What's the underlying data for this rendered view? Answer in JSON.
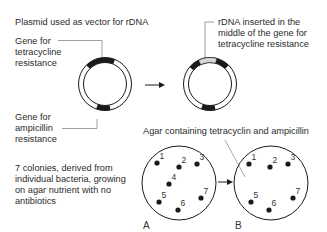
{
  "title": "Plasmid used as vector for rDNA",
  "labels": {
    "tet_gene": [
      "Gene for",
      "tetracycline",
      "resistance"
    ],
    "amp_gene": [
      "Gene for",
      "ampicillin",
      "resistance"
    ],
    "rdna": [
      "rDNA inserted in the",
      "middle of the gene for",
      "tetracycline resistance"
    ],
    "colonies": [
      "7 colonies, derived from",
      "individual bacteria, growing",
      "on agar nutrient with no",
      "antibiotics"
    ],
    "agar": "Agar containing tetracyclin and ampicillin"
  },
  "dishes": {
    "A": {
      "label": "A",
      "colonies": [
        {
          "n": "1",
          "x": 157,
          "y": 163
        },
        {
          "n": "2",
          "x": 179,
          "y": 167
        },
        {
          "n": "3",
          "x": 197,
          "y": 164
        },
        {
          "n": "4",
          "x": 169,
          "y": 184
        },
        {
          "n": "5",
          "x": 159,
          "y": 202
        },
        {
          "n": "6",
          "x": 178,
          "y": 210
        },
        {
          "n": "7",
          "x": 201,
          "y": 198
        }
      ]
    },
    "B": {
      "label": "B",
      "colonies": [
        {
          "n": "1",
          "x": 249,
          "y": 164
        },
        {
          "n": "2",
          "x": 270,
          "y": 167
        },
        {
          "n": "3",
          "x": 288,
          "y": 164
        },
        {
          "n": "5",
          "x": 251,
          "y": 202
        },
        {
          "n": "6",
          "x": 269,
          "y": 210
        },
        {
          "n": "7",
          "x": 293,
          "y": 198
        }
      ]
    }
  },
  "colors": {
    "ink": "#1a1a1a",
    "text": "#2b2b2b",
    "insert": "#d8d8d8",
    "leader": "#777777"
  }
}
